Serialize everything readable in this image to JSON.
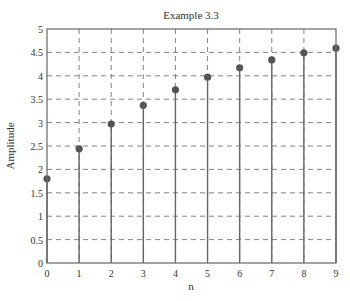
{
  "chart_data": {
    "type": "stem",
    "title": "Example 3.3",
    "xlabel": "n",
    "ylabel": "Amplitude",
    "x": [
      0,
      1,
      2,
      3,
      4,
      5,
      6,
      7,
      8,
      9
    ],
    "values": [
      1.8,
      2.44,
      2.97,
      3.37,
      3.7,
      3.97,
      4.17,
      4.34,
      4.49,
      4.59
    ],
    "xlim": [
      0,
      9
    ],
    "ylim": [
      0,
      5
    ],
    "xticks": [
      "0",
      "1",
      "2",
      "3",
      "4",
      "5",
      "6",
      "7",
      "8",
      "9"
    ],
    "yticks": [
      "0",
      "0.5",
      "1",
      "1.5",
      "2",
      "2.5",
      "3",
      "3.5",
      "4",
      "4.5",
      "5"
    ],
    "grid": true,
    "grid_style": "dashed",
    "legend": null
  },
  "colors": {
    "stem": "#666666",
    "marker": "#555555",
    "axes": "#666666",
    "grid": "#777777",
    "text": "#333333"
  }
}
